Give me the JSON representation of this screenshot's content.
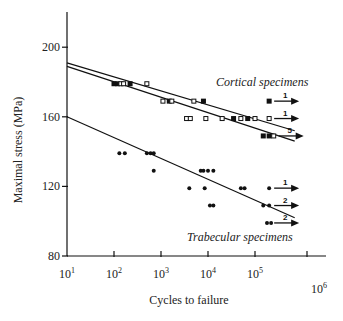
{
  "chart_data": {
    "type": "scatter",
    "title": "",
    "xlabel": "Cycles to failure",
    "ylabel": "Maximal stress (MPa)",
    "xscale": "log",
    "xlim": [
      10,
      1000000
    ],
    "ylim": [
      80,
      210
    ],
    "x_tick_labels": [
      "10^1",
      "10^2",
      "10^3",
      "10^4",
      "10^5",
      "10^6"
    ],
    "y_tick_labels": [
      "80",
      "120",
      "160",
      "200"
    ],
    "grid": false,
    "annotations": [
      "Cortical specimens",
      "Trabecular specimens"
    ],
    "series": [
      {
        "name": "Cortical specimens (filled squares)",
        "marker": "filled-square",
        "points": [
          [
            100,
            179
          ],
          [
            120,
            179
          ],
          [
            220,
            179
          ],
          [
            1500,
            169
          ],
          [
            8000,
            169
          ],
          [
            35000,
            159
          ],
          [
            70000,
            159
          ],
          [
            150000,
            149
          ],
          [
            200000,
            169
          ],
          [
            200000,
            149
          ]
        ]
      },
      {
        "name": "Cortical specimens (open squares)",
        "marker": "open-square",
        "points": [
          [
            140,
            179
          ],
          [
            160,
            179
          ],
          [
            500,
            179
          ],
          [
            1100,
            169
          ],
          [
            1700,
            169
          ],
          [
            3500,
            159
          ],
          [
            4200,
            159
          ],
          [
            5000,
            169
          ],
          [
            9000,
            159
          ],
          [
            20000,
            159
          ],
          [
            50000,
            159
          ],
          [
            100000,
            159
          ],
          [
            200000,
            159
          ],
          [
            250000,
            149
          ]
        ]
      },
      {
        "name": "Trabecular specimens",
        "marker": "filled-circle",
        "points": [
          [
            130,
            139
          ],
          [
            170,
            139
          ],
          [
            500,
            139
          ],
          [
            600,
            139
          ],
          [
            700,
            139
          ],
          [
            700,
            129
          ],
          [
            4000,
            119
          ],
          [
            7000,
            129
          ],
          [
            8000,
            129
          ],
          [
            8500,
            119
          ],
          [
            10000,
            129
          ],
          [
            13000,
            129
          ],
          [
            11000,
            109
          ],
          [
            13000,
            109
          ],
          [
            50000,
            119
          ],
          [
            60000,
            119
          ],
          [
            150000,
            109
          ],
          [
            200000,
            119
          ],
          [
            200000,
            109
          ],
          [
            180000,
            99
          ],
          [
            220000,
            99
          ]
        ]
      },
      {
        "name": "Cortical fit (upper)",
        "type": "line",
        "points": [
          [
            10,
            191
          ],
          [
            700000,
            152
          ]
        ]
      },
      {
        "name": "Cortical fit (lower)",
        "type": "line",
        "points": [
          [
            10,
            189
          ],
          [
            700000,
            146
          ]
        ]
      },
      {
        "name": "Trabecular fit",
        "type": "line",
        "points": [
          [
            10,
            160
          ],
          [
            700000,
            102
          ]
        ]
      }
    ],
    "runouts": [
      {
        "group": "cortical",
        "stress": 169,
        "cycles": 200000,
        "count": "1"
      },
      {
        "group": "cortical",
        "stress": 159,
        "cycles": 200000,
        "count": "1"
      },
      {
        "group": "cortical",
        "stress": 149,
        "cycles": 250000,
        "count": "5"
      },
      {
        "group": "trabecular",
        "stress": 119,
        "cycles": 200000,
        "count": "1"
      },
      {
        "group": "trabecular",
        "stress": 109,
        "cycles": 200000,
        "count": "2"
      },
      {
        "group": "trabecular",
        "stress": 99,
        "cycles": 200000,
        "count": "2"
      }
    ]
  },
  "labels": {
    "ylabel": "Maximal stress (MPa)",
    "xlabel": "Cycles to failure",
    "cortical": "Cortical specimens",
    "trabecular": "Trabecular specimens",
    "y_ticks": [
      {
        "label": "200",
        "value": 200
      },
      {
        "label": "160",
        "value": 160
      },
      {
        "label": "120",
        "value": 120
      },
      {
        "label": "80",
        "value": 80
      }
    ],
    "x_ticks": [
      {
        "base": "10",
        "exp": "1",
        "value": 1
      },
      {
        "base": "10",
        "exp": "2",
        "value": 2
      },
      {
        "base": "10",
        "exp": "3",
        "value": 3
      },
      {
        "base": "10",
        "exp": "4",
        "value": 4
      },
      {
        "base": "10",
        "exp": "5",
        "value": 5
      },
      {
        "base": "10",
        "exp": "6",
        "value": 6
      }
    ]
  }
}
